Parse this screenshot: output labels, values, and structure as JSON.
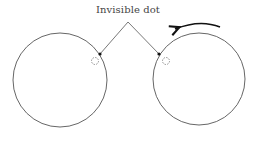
{
  "diagram": {
    "label": "Invisible dot",
    "colors": {
      "stroke": "#555555",
      "dot": "#111111",
      "arrow": "#111111",
      "dashed": "#777777"
    },
    "circles": [
      {
        "name": "left-circle",
        "cx": 60,
        "cy": 80,
        "r": 47
      },
      {
        "name": "right-circle",
        "cx": 199,
        "cy": 79,
        "r": 46
      }
    ],
    "pointer_apex": {
      "x": 128,
      "y": 22
    },
    "dots": [
      {
        "name": "left-visible-dot",
        "x": 100,
        "y": 54
      },
      {
        "name": "right-visible-dot",
        "x": 159,
        "y": 54
      }
    ],
    "invisible_dots": [
      {
        "name": "left-invisible-dot",
        "x": 95,
        "y": 61,
        "r": 3.5
      },
      {
        "name": "right-invisible-dot",
        "x": 166,
        "y": 61,
        "r": 3.5
      }
    ],
    "rotation_arrow": {
      "direction": "counterclockwise"
    }
  }
}
